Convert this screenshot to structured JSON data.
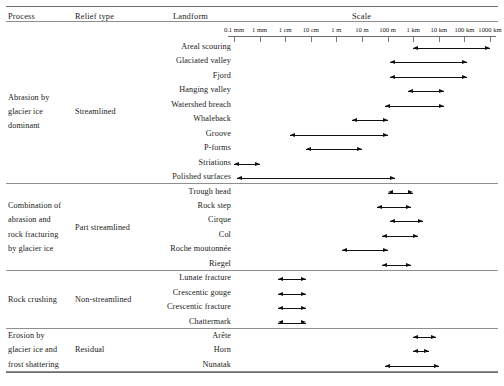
{
  "header": {
    "columns": [
      "Process",
      "Relief type",
      "Landform",
      "Scale"
    ]
  },
  "axis": {
    "tick_labels": [
      "0.1 mm",
      "1 mm",
      "1 cm",
      "10 cm",
      "1 m",
      "10 m",
      "100 m",
      "1 km",
      "10 km",
      "100 km",
      "1000 km"
    ],
    "tick_log_m": [
      -4,
      -3,
      -2,
      -1,
      0,
      1,
      2,
      3,
      4,
      5,
      6
    ]
  },
  "groups": [
    {
      "process": [
        "Abrasion by",
        "glacier ice",
        "dominant"
      ],
      "relief": "Streamlined",
      "rows": [
        {
          "landform": "Areal scouring",
          "from": 3.0,
          "to": 6.0
        },
        {
          "landform": "Glaciated valley",
          "from": 2.1,
          "to": 5.1
        },
        {
          "landform": "Fjord",
          "from": 2.1,
          "to": 5.1
        },
        {
          "landform": "Hanging valley",
          "from": 2.8,
          "to": 4.2
        },
        {
          "landform": "Watershed breach",
          "from": 1.9,
          "to": 4.2
        },
        {
          "landform": "Whaleback",
          "from": 0.6,
          "to": 2.0
        },
        {
          "landform": "Groove",
          "from": -1.8,
          "to": 2.0
        },
        {
          "landform": "P-forms",
          "from": -1.2,
          "to": 1.0
        },
        {
          "landform": "Striations",
          "from": -4.0,
          "to": -3.0
        },
        {
          "landform": "Polished surfaces",
          "from": -3.9,
          "to": 2.3
        }
      ]
    },
    {
      "process": [
        "Combination of",
        "abrasion and",
        "rock fracturing",
        "by glacier ice"
      ],
      "relief": "Part streamlined",
      "rows": [
        {
          "landform": "Trough head",
          "from": 2.0,
          "to": 3.0
        },
        {
          "landform": "Rock step",
          "from": 1.6,
          "to": 2.9
        },
        {
          "landform": "Cirque",
          "from": 2.1,
          "to": 3.4
        },
        {
          "landform": "Col",
          "from": 1.8,
          "to": 3.2
        },
        {
          "landform": "Roche moutonnée",
          "from": 0.2,
          "to": 2.0
        },
        {
          "landform": "Riegel",
          "from": 1.8,
          "to": 2.9
        }
      ]
    },
    {
      "process": [
        "Rock crushing"
      ],
      "relief": "Non-streamlined",
      "rows": [
        {
          "landform": "Lunate fracture",
          "from": -2.3,
          "to": -1.2
        },
        {
          "landform": "Crescentic gouge",
          "from": -2.3,
          "to": -1.2
        },
        {
          "landform": "Crescentic fracture",
          "from": -2.3,
          "to": -1.2
        },
        {
          "landform": "Chattermark",
          "from": -2.3,
          "to": -1.2
        }
      ]
    },
    {
      "process": [
        "Erosion by",
        "glacier ice and",
        "frost shattering"
      ],
      "relief": "Residual",
      "rows": [
        {
          "landform": "Arête",
          "from": 3.0,
          "to": 3.9
        },
        {
          "landform": "Horn",
          "from": 3.0,
          "to": 3.6
        },
        {
          "landform": "Nunatak",
          "from": 1.9,
          "to": 4.0
        }
      ]
    }
  ],
  "chart_data": {
    "type": "bar",
    "title": "Scale",
    "xlabel": "Scale",
    "ylabel": "Landform",
    "orientation": "horizontal",
    "x_scale": "log10 (metres)",
    "xlim": [
      -4,
      6
    ],
    "grid": false,
    "legend": null,
    "tick_labels": [
      "0.1 mm",
      "1 mm",
      "1 cm",
      "10 cm",
      "1 m",
      "10 m",
      "100 m",
      "1 km",
      "10 km",
      "100 km",
      "1000 km"
    ],
    "tick_values_log_m": [
      -4,
      -3,
      -2,
      -1,
      0,
      1,
      2,
      3,
      4,
      5,
      6
    ],
    "categories": [
      "Areal scouring",
      "Glaciated valley",
      "Fjord",
      "Hanging valley",
      "Watershed breach",
      "Whaleback",
      "Groove",
      "P-forms",
      "Striations",
      "Polished surfaces",
      "Trough head",
      "Rock step",
      "Cirque",
      "Col",
      "Roche moutonnée",
      "Riegel",
      "Lunate fracture",
      "Crescentic gouge",
      "Crescentic fracture",
      "Chattermark",
      "Arête",
      "Horn",
      "Nunatak"
    ],
    "ranges_log10_m": [
      [
        3.0,
        6.0
      ],
      [
        2.1,
        5.1
      ],
      [
        2.1,
        5.1
      ],
      [
        2.8,
        4.2
      ],
      [
        1.9,
        4.2
      ],
      [
        0.6,
        2.0
      ],
      [
        -1.8,
        2.0
      ],
      [
        -1.2,
        1.0
      ],
      [
        -4.0,
        -3.0
      ],
      [
        -3.9,
        2.3
      ],
      [
        2.0,
        3.0
      ],
      [
        1.6,
        2.9
      ],
      [
        2.1,
        3.4
      ],
      [
        1.8,
        3.2
      ],
      [
        0.2,
        2.0
      ],
      [
        1.8,
        2.9
      ],
      [
        -2.3,
        -1.2
      ],
      [
        -2.3,
        -1.2
      ],
      [
        -2.3,
        -1.2
      ],
      [
        -2.3,
        -1.2
      ],
      [
        3.0,
        3.9
      ],
      [
        3.0,
        3.6
      ],
      [
        1.9,
        4.0
      ]
    ],
    "annotations": "Each row is a double-headed arrow spanning the characteristic size range of the landform."
  }
}
